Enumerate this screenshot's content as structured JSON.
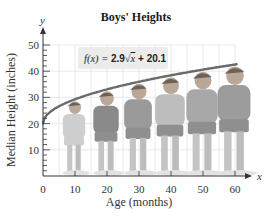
{
  "chart_data": {
    "type": "line",
    "title": "Boys' Heights",
    "xlabel": "Age (months)",
    "ylabel": "Median Height (inches)",
    "x_axis_var": "x",
    "y_axis_var": "y",
    "xlim": [
      0,
      65
    ],
    "ylim": [
      0,
      50
    ],
    "x_ticks": [
      0,
      10,
      20,
      30,
      40,
      50,
      60
    ],
    "y_ticks": [
      10,
      20,
      30,
      40,
      50
    ],
    "grid": true,
    "annotation": {
      "prefix": "f(x) = ",
      "coef": "2.9",
      "radicand": "x",
      "suffix": " + 20.1",
      "full": "f(x) = 2.9√x + 20.1"
    },
    "series": [
      {
        "name": "f(x) = 2.9√x + 20.1",
        "x": [
          0,
          5,
          10,
          15,
          20,
          25,
          30,
          35,
          40,
          45,
          50,
          55,
          60,
          65
        ],
        "values": [
          20.1,
          26.6,
          29.3,
          31.3,
          33.1,
          34.6,
          36.0,
          37.3,
          38.4,
          39.6,
          40.6,
          41.6,
          42.6,
          43.5
        ]
      }
    ],
    "illustrations": [
      {
        "label": "boy at 10 months",
        "age": 10,
        "height": 29.3
      },
      {
        "label": "boy at 20 months",
        "age": 20,
        "height": 33.1
      },
      {
        "label": "boy at 30 months",
        "age": 30,
        "height": 36.0
      },
      {
        "label": "boy at 40 months",
        "age": 40,
        "height": 38.4
      },
      {
        "label": "boy at 50 months",
        "age": 50,
        "height": 40.6
      },
      {
        "label": "boy at 60 months",
        "age": 60,
        "height": 42.6
      }
    ],
    "colors": {
      "curve": "#6b6b6b",
      "grid": "#e4e4e4",
      "axis": "#333333",
      "label_box": "#ececec"
    }
  }
}
